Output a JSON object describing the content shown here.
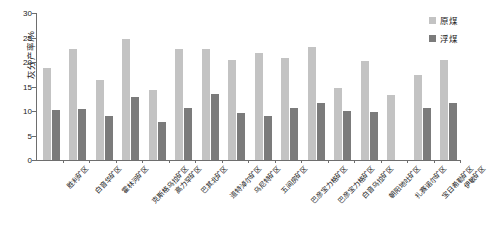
{
  "chart_data": {
    "type": "bar",
    "title": "",
    "xlabel": "",
    "ylabel": "灰分产率/%",
    "ylim": [
      0,
      30
    ],
    "ytick_step": 5,
    "yticks": [
      0,
      5,
      10,
      15,
      20,
      25,
      30
    ],
    "grid": false,
    "legend_position": "top-right",
    "categories": [
      "胜利矿区",
      "白音华矿区",
      "霍林河矿区",
      "克斯格乌拉矿区",
      "高力罕矿区",
      "巴其北矿区",
      "道特淖尔矿区",
      "乌尼特矿区",
      "五间房矿区",
      "巴彦宝力格矿区",
      "巴彦宝力格矿区",
      "白音乌拉矿区",
      "朝阳地吐矿区",
      "扎赛诺尔矿区",
      "宝日希勒矿区",
      "伊敏矿区"
    ],
    "series": [
      {
        "name": "原煤",
        "color": "#c3c3c3",
        "values": [
          18.8,
          22.7,
          16.3,
          24.6,
          14.2,
          22.6,
          22.7,
          20.4,
          21.9,
          20.9,
          23.0,
          14.6,
          20.2,
          13.3,
          17.4,
          20.4
        ]
      },
      {
        "name": "浮煤",
        "color": "#7b7b7b",
        "values": [
          10.3,
          10.4,
          8.9,
          12.8,
          7.7,
          10.7,
          13.5,
          9.6,
          8.9,
          10.6,
          11.7,
          10.0,
          9.8,
          null,
          10.6,
          11.7
        ]
      }
    ]
  },
  "legend": {
    "items": [
      {
        "label": "原煤",
        "swatch": "raw-coal-swatch"
      },
      {
        "label": "浮煤",
        "swatch": "float-coal-swatch"
      }
    ]
  },
  "axis": {
    "y_title": "灰分产率/%",
    "y_tick_labels": [
      "0",
      "5",
      "10",
      "15",
      "20",
      "25",
      "30"
    ]
  }
}
